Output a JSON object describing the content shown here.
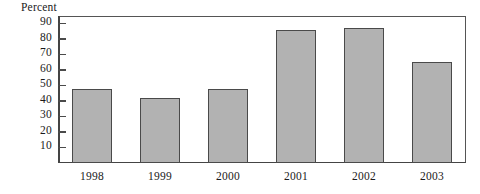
{
  "chart_data": {
    "type": "bar",
    "title": "",
    "xlabel": "",
    "ylabel": "Percent",
    "categories": [
      "1998",
      "1999",
      "2000",
      "2001",
      "2002",
      "2003"
    ],
    "values": [
      48,
      42,
      48,
      86,
      87,
      65
    ],
    "ylim": [
      0,
      95
    ],
    "yticks": [
      10,
      20,
      30,
      40,
      50,
      60,
      70,
      80,
      90
    ],
    "ytick_labels": [
      "10",
      "20",
      "30",
      "40",
      "50",
      "60",
      "70",
      "80",
      "90"
    ],
    "grid": false,
    "legend": null,
    "bar_color": "#b2b2b2",
    "bar_edge_color": "#4a4a4a",
    "axis_color": "#4a4a4a",
    "text_color": "#1a1a1a",
    "background": "#ffffff"
  }
}
